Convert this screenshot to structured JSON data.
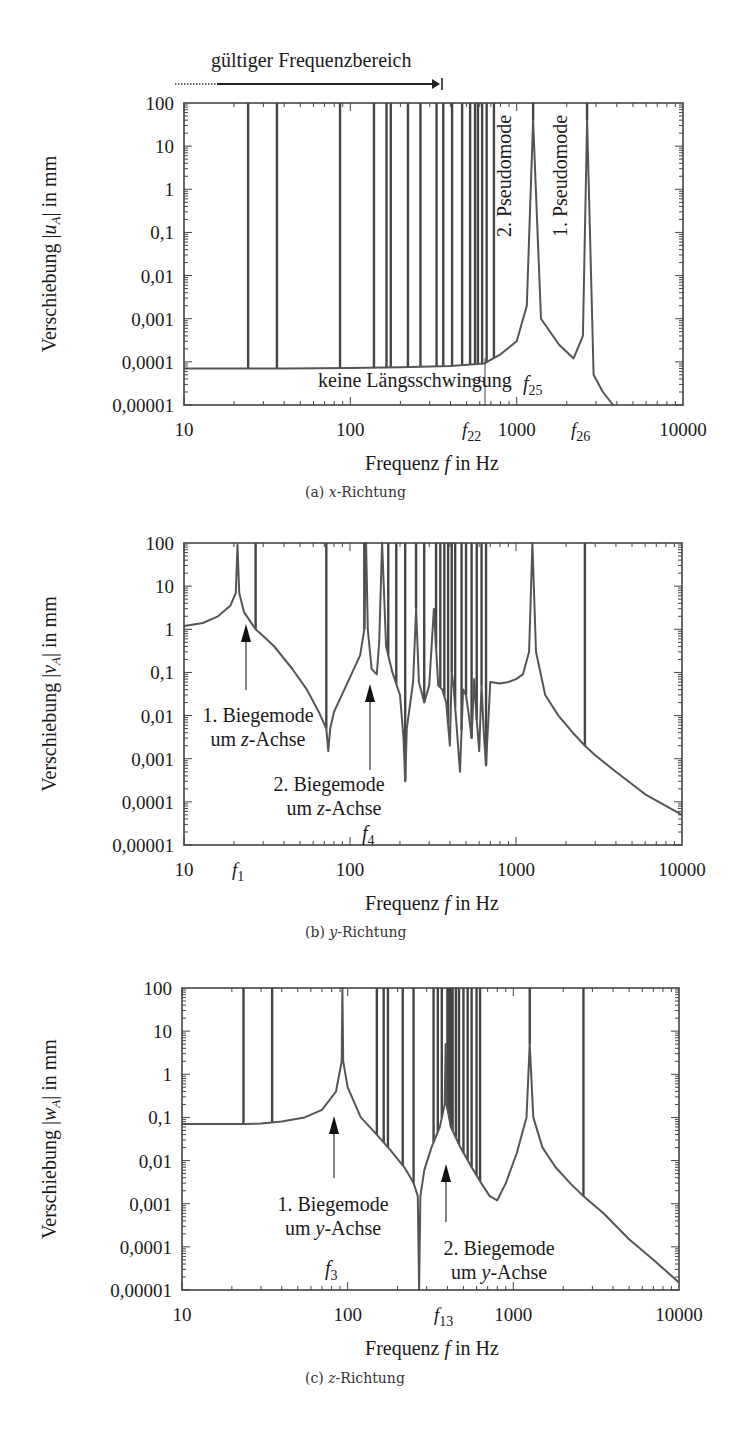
{
  "chart_data": [
    {
      "type": "line",
      "id": "a",
      "caption": "(a) x-Richtung",
      "caption_prefix": "(a) ",
      "caption_var": "x",
      "caption_suffix": "-Richtung",
      "xlabel": "Frequenz f in Hz",
      "ylabel": "Verschiebung |u_A| in mm",
      "ylabel_var": "u",
      "xscale": "log",
      "yscale": "log",
      "xlim": [
        10,
        10000
      ],
      "ylim": [
        1e-05,
        100
      ],
      "xticks": [
        "10",
        "100",
        "1000",
        "10000"
      ],
      "yticks": [
        "100",
        "10",
        "1",
        "0,1",
        "0,01",
        "0,001",
        "0,0001",
        "0,00001"
      ],
      "range_annotation": "gültiger Frequenzbereich",
      "annotations": [
        "2. Pseudomode",
        "1. Pseudomode",
        "keine Längsschwingung",
        "f22",
        "f25",
        "f26"
      ],
      "resonance_freqs_hz": [
        24.3,
        36.2,
        86.7,
        138.7,
        165,
        175,
        222,
        264,
        330,
        362,
        409,
        470,
        525,
        562,
        585,
        620,
        660,
        730,
        1256,
        2650
      ],
      "curve": {
        "x": [
          10,
          23.5,
          25,
          40,
          100,
          200,
          400,
          640,
          800,
          1000,
          1150,
          1256,
          1400,
          1800,
          2200,
          2500,
          2650,
          2900,
          3300,
          3800
        ],
        "y": [
          7e-05,
          7e-05,
          7e-05,
          7e-05,
          7.2e-05,
          7.5e-05,
          8e-05,
          9.2e-05,
          0.00015,
          0.0003,
          0.002,
          40,
          0.001,
          0.00025,
          0.00012,
          0.0004,
          40,
          5e-05,
          2e-05,
          1e-05
        ]
      },
      "markers": {
        "f22": 640,
        "f25": 1256,
        "f26": 2650
      }
    },
    {
      "type": "line",
      "id": "b",
      "caption": "(b) y-Richtung",
      "xlabel": "Frequenz f in Hz",
      "ylabel": "Verschiebung |v_A| in mm",
      "xscale": "log",
      "yscale": "log",
      "xlim": [
        10,
        10000
      ],
      "ylim": [
        1e-05,
        100
      ],
      "xticks": [
        "10",
        "100",
        "1000",
        "10000"
      ],
      "yticks": [
        "100",
        "10",
        "1",
        "0,1",
        "0,01",
        "0,001",
        "0,0001",
        "0,00001"
      ],
      "annotations": [
        "1. Biegemode um z-Achse",
        "2. Biegemode um z-Achse",
        "f1",
        "f4"
      ],
      "markers": {
        "f1": 21,
        "f4": 125
      },
      "curve": {
        "x": [
          10,
          13,
          16,
          19,
          20.5,
          21,
          21.5,
          23,
          27,
          30,
          35,
          45,
          55,
          65,
          72,
          74,
          76,
          80,
          95,
          115,
          122,
          125,
          128,
          135,
          145,
          150,
          156,
          165,
          180,
          200,
          210,
          215,
          220,
          240,
          250,
          260,
          280,
          300,
          320,
          340,
          360,
          380,
          400,
          410,
          420,
          440,
          460,
          480,
          500,
          520,
          540,
          560,
          580,
          600,
          620,
          640,
          660,
          700,
          800,
          900,
          1000,
          1100,
          1200,
          1256,
          1320,
          1500,
          1800,
          2200,
          2600,
          3000,
          4000,
          6000,
          10000
        ],
        "y": [
          1.2,
          1.4,
          2,
          3.5,
          7,
          90,
          7,
          2.5,
          1,
          0.7,
          0.4,
          0.12,
          0.04,
          0.012,
          0.005,
          0.0015,
          0.005,
          0.012,
          0.05,
          0.25,
          1,
          100,
          1,
          0.12,
          0.09,
          0.5,
          100,
          0.4,
          0.1,
          0.03,
          0.003,
          0.0003,
          0.005,
          0.06,
          3,
          0.06,
          0.02,
          0.05,
          3,
          0.05,
          0.04,
          0.02,
          0.002,
          0.1,
          0.05,
          0.005,
          0.0005,
          0.04,
          0.03,
          0.01,
          0.003,
          0.07,
          0.008,
          0.0015,
          0.05,
          0.004,
          0.0007,
          0.06,
          0.055,
          0.06,
          0.07,
          0.09,
          0.3,
          100,
          0.3,
          0.03,
          0.01,
          0.004,
          0.002,
          0.0012,
          0.0005,
          0.00015,
          5e-05
        ]
      },
      "resonance_freqs_hz": [
        27,
        72,
        122,
        156,
        170,
        190,
        215,
        250,
        280,
        330,
        350,
        370,
        390,
        410,
        430,
        470,
        500,
        540,
        580,
        620,
        660,
        1256,
        2600
      ]
    },
    {
      "type": "line",
      "id": "c",
      "caption": "(c) z-Richtung",
      "xlabel": "Frequenz f in Hz",
      "ylabel": "Verschiebung |w_A| in mm",
      "xscale": "log",
      "yscale": "log",
      "xlim": [
        10,
        10000
      ],
      "ylim": [
        1e-05,
        100
      ],
      "xticks": [
        "10",
        "100",
        "1000",
        "10000"
      ],
      "yticks": [
        "100",
        "10",
        "1",
        "0,1",
        "0,01",
        "0,001",
        "0,0001",
        "0,00001"
      ],
      "annotations": [
        "1. Biegemode um y-Achse",
        "2. Biegemode um y-Achse",
        "f3",
        "f13"
      ],
      "markers": {
        "f3": 93,
        "f13": 390
      },
      "curve": {
        "x": [
          10,
          20,
          24,
          30,
          40,
          55,
          70,
          85,
          92,
          93,
          94,
          100,
          120,
          150,
          180,
          220,
          250,
          265,
          270,
          275,
          290,
          320,
          360,
          385,
          390,
          395,
          420,
          480,
          560,
          640,
          720,
          800,
          900,
          1050,
          1200,
          1256,
          1320,
          1500,
          1800,
          2200,
          2600,
          3500,
          5000,
          7000,
          10000
        ],
        "y": [
          0.07,
          0.07,
          0.07,
          0.072,
          0.08,
          0.1,
          0.15,
          0.4,
          2,
          100,
          2,
          0.5,
          0.1,
          0.04,
          0.018,
          0.007,
          0.003,
          0.0015,
          1e-05,
          0.0015,
          0.006,
          0.02,
          0.06,
          0.2,
          5,
          0.2,
          0.06,
          0.02,
          0.007,
          0.003,
          0.0015,
          0.0012,
          0.003,
          0.015,
          0.1,
          5,
          0.1,
          0.02,
          0.007,
          0.003,
          0.0016,
          0.0006,
          0.00015,
          5e-05,
          1.5e-05
        ]
      },
      "resonance_freqs_hz": [
        23.5,
        35,
        93,
        150,
        165,
        175,
        215,
        250,
        330,
        350,
        370,
        400,
        410,
        420,
        430,
        450,
        470,
        500,
        530,
        560,
        600,
        630,
        1256,
        2650
      ]
    }
  ],
  "plots": {
    "a": {
      "caption_prefix": "(a) ",
      "caption_var": "x",
      "caption_suffix": "-Richtung",
      "ylabel_pre": "Verschiebung |",
      "ylabel_var": "u",
      "ylabel_sub": "A",
      "ylabel_post": "| in mm",
      "xlabel_pre": "Frequenz ",
      "xlabel_var": "f",
      "xlabel_post": " in Hz",
      "range_annotation": "gültiger Frequenzbereich",
      "pseudo2": "2. Pseudomode",
      "pseudo1": "1. Pseudomode",
      "no_long": "keine Längsschwingung",
      "f22_sym": "f",
      "f22_sub": "22",
      "f25_sym": "f",
      "f25_sub": "25",
      "f26_sym": "f",
      "f26_sub": "26"
    },
    "b": {
      "caption_prefix": "(b) ",
      "caption_var": "y",
      "caption_suffix": "-Richtung",
      "ylabel_pre": "Verschiebung |",
      "ylabel_var": "v",
      "ylabel_sub": "A",
      "ylabel_post": "| in mm",
      "xlabel_pre": "Frequenz ",
      "xlabel_var": "f",
      "xlabel_post": " in Hz",
      "mode1_l1": "1. Biegemode",
      "mode1_l2_pre": "um ",
      "mode1_l2_var": "z",
      "mode1_l2_post": "-Achse",
      "mode2_l1": "2. Biegemode",
      "mode2_l2_pre": "um ",
      "mode2_l2_var": "z",
      "mode2_l2_post": "-Achse",
      "f1_sym": "f",
      "f1_sub": "1",
      "f4_sym": "f",
      "f4_sub": "4"
    },
    "c": {
      "caption_prefix": "(c) ",
      "caption_var": "z",
      "caption_suffix": "-Richtung",
      "ylabel_pre": "Verschiebung |",
      "ylabel_var": "w",
      "ylabel_sub": "A",
      "ylabel_post": "| in mm",
      "xlabel_pre": "Frequenz ",
      "xlabel_var": "f",
      "xlabel_post": " in Hz",
      "mode1_l1": "1. Biegemode",
      "mode1_l2_pre": "um ",
      "mode1_l2_var": "y",
      "mode1_l2_post": "-Achse",
      "mode2_l1": "2. Biegemode",
      "mode2_l2_pre": "um ",
      "mode2_l2_var": "y",
      "mode2_l2_post": "-Achse",
      "f3_sym": "f",
      "f3_sub": "3",
      "f13_sym": "f",
      "f13_sub": "13"
    }
  },
  "ticks": {
    "x": [
      "10",
      "100",
      "1000",
      "10000"
    ],
    "y": [
      "100",
      "10",
      "1",
      "0,1",
      "0,01",
      "0,001",
      "0,0001",
      "0,00001"
    ]
  },
  "colors": {
    "curve": "#555555",
    "frame": "#444444",
    "text": "#1a1a1a"
  }
}
